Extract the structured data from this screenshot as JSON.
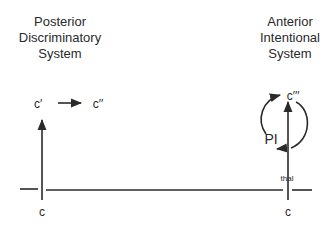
{
  "diagram": {
    "left_system": {
      "title_lines": [
        "Posterior",
        "Discriminatory",
        "System"
      ],
      "base_label": "c",
      "upper_label": "c′",
      "arrow_target_label": "c′′"
    },
    "right_system": {
      "title_lines": [
        "Anterior",
        "Intentional",
        "System"
      ],
      "base_label": "c",
      "top_label": "c′′′",
      "loop_label": "PI",
      "pathway_label": "thal"
    }
  }
}
